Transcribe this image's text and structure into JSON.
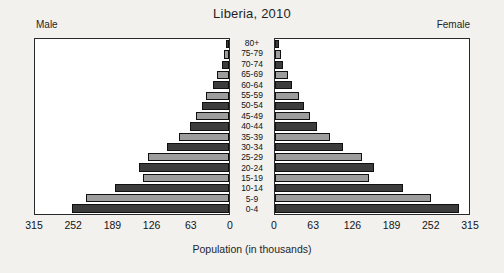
{
  "chart_data": {
    "type": "bar",
    "subtype": "population-pyramid",
    "title": "Liberia, 2010",
    "xlabel": "Population (in thousands)",
    "ylabel": "",
    "left_header": "Male",
    "right_header": "Female",
    "categories": [
      "80+",
      "75-79",
      "70-74",
      "65-69",
      "60-64",
      "55-59",
      "50-54",
      "45-49",
      "40-44",
      "35-39",
      "30-34",
      "25-29",
      "20-24",
      "15-19",
      "10-14",
      "5-9",
      "0-4"
    ],
    "axis_max": 315,
    "axis_min": 0,
    "tick_values": [
      315,
      252,
      189,
      126,
      63,
      0,
      0,
      63,
      126,
      189,
      252,
      315
    ],
    "left_tick_labels": [
      "315",
      "252",
      "189",
      "126",
      "63",
      "0"
    ],
    "right_tick_labels": [
      "0",
      "63",
      "126",
      "189",
      "252",
      "315"
    ],
    "grid": false,
    "legend": "none",
    "colors": {
      "dark_bar": "#3c3c3c",
      "light_bar": "#9d9d9d",
      "bar_outline": "#101010",
      "frame": "#2a2a2a",
      "panel_background": "#ffffff",
      "page_background": "#f2f1ee"
    },
    "series": [
      {
        "name": "Male",
        "direction": "left",
        "values": [
          5,
          8,
          12,
          19,
          26,
          37,
          44,
          53,
          62,
          80,
          100,
          130,
          145,
          139,
          183,
          230,
          253
        ]
      },
      {
        "name": "Female",
        "direction": "right",
        "values": [
          6,
          9,
          13,
          21,
          28,
          39,
          46,
          56,
          68,
          88,
          110,
          140,
          159,
          151,
          206,
          250,
          296
        ]
      }
    ]
  }
}
